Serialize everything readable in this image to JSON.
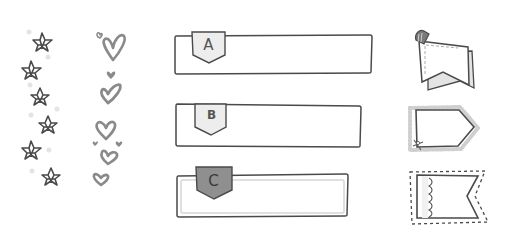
{
  "palette": {
    "stroke": "#4a4a4a",
    "heart": "#8a8a8a",
    "tab_fill_light": "#e6e6e6",
    "tab_fill_dark": "#8e8e8e",
    "paper": "#ffffff",
    "dot": "#e2e2e2"
  },
  "decorations": {
    "stars": {
      "icon": "star-icon",
      "count": 6
    },
    "hearts": {
      "icon": "heart-icon",
      "count": 9
    }
  },
  "labels": [
    {
      "id": "a",
      "tab_text": "A",
      "tab_style": "light"
    },
    {
      "id": "b",
      "tab_text": "B",
      "tab_style": "light"
    },
    {
      "id": "c",
      "tab_text": "C",
      "tab_style": "dark"
    }
  ],
  "banners": [
    {
      "id": "clipped-note",
      "icon": "clip-note-icon"
    },
    {
      "id": "lace-tag",
      "icon": "lace-tag-icon"
    },
    {
      "id": "pennant-flag",
      "icon": "flag-icon"
    }
  ]
}
